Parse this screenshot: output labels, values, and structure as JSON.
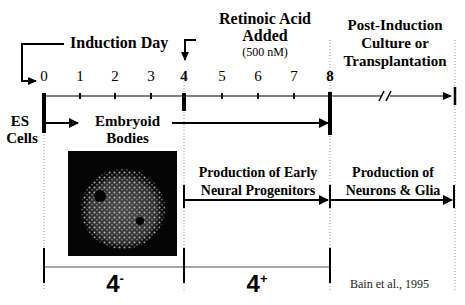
{
  "diagram": {
    "title_labels": {
      "induction_day": "Induction Day",
      "retinoic_acid_line1": "Retinoic Acid",
      "retinoic_acid_line2": "Added",
      "retinoic_acid_conc": "(500 nM)",
      "post_induction_line1": "Post-Induction",
      "post_induction_line2": "Culture or",
      "post_induction_line3": "Transplantation"
    },
    "timeline": {
      "ticks": [
        "0",
        "1",
        "2",
        "3",
        "4",
        "5",
        "6",
        "7",
        "8"
      ],
      "break_marker": "//"
    },
    "stages": {
      "es_cells_line1": "ES",
      "es_cells_line2": "Cells",
      "embryoid_line1": "Embryoid",
      "embryoid_line2": "Bodies",
      "early_neural_line1": "Production of Early",
      "early_neural_line2": "Neural Progenitors",
      "neurons_glia_line1": "Production of",
      "neurons_glia_line2": "Neurons & Glia"
    },
    "image": {
      "description": "embryoid-body-micrograph"
    },
    "brackets": {
      "minus_base": "4",
      "minus_sup": "-",
      "plus_base": "4",
      "plus_sup": "+"
    },
    "citation": "Bain et al., 1995"
  }
}
